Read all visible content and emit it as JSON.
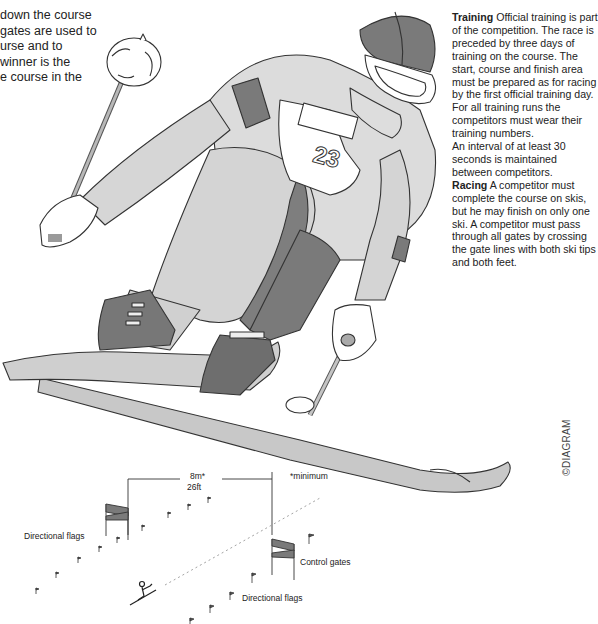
{
  "intro": {
    "lines": [
      "down the course",
      " gates are used to",
      "urse and to",
      " winner is the",
      "e course in the"
    ]
  },
  "rules": {
    "training_heading": "Training",
    "training_text": " Official training is part of the competition. The race is preceded by three days of training on the course. The start, course and finish area must be prepared as for racing by the first official training day.",
    "training_text_2": "For all training runs the competitors must wear their training numbers.",
    "training_text_3": "An interval of at least 30 seconds is maintained between competitors.",
    "racing_heading": "Racing",
    "racing_text": " A competitor must complete the course on skis, but he may finish on only one ski. A competitor must pass through all gates by crossing the gate lines with both ski tips and both feet."
  },
  "illustration": {
    "bib_number": "23",
    "colors": {
      "dark_grey": "#7a7a7a",
      "mid_grey": "#b3b3b3",
      "light_grey": "#d9d9d9",
      "outline": "#333333"
    }
  },
  "course_diagram": {
    "distance_metric": "8m*",
    "distance_imperial": "26ft",
    "footnote": "*minimum",
    "label_directional_flags_left": "Directional flags",
    "label_control_gates": "Control gates",
    "label_directional_flags_right": "Directional flags"
  },
  "copyright": "©DIAGRAM"
}
